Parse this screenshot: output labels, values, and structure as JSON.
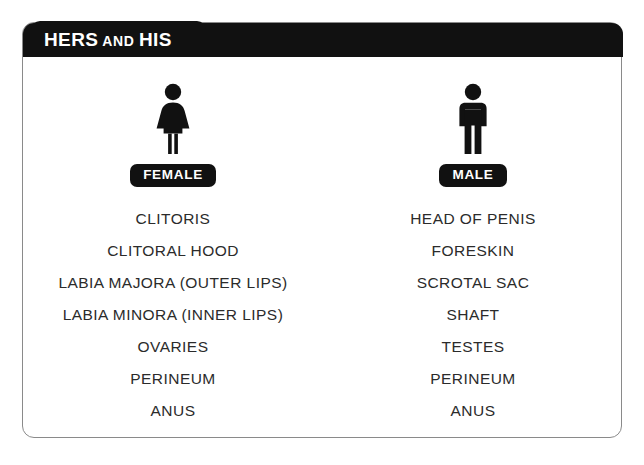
{
  "page": {
    "background_color": "#ffffff",
    "card_border_color": "#8a8a8a",
    "accent_color": "#111111",
    "text_color": "#2b2b2b"
  },
  "header": {
    "title_part1": "HERS",
    "title_conjunction": "AND",
    "title_part2": "HIS"
  },
  "columns": [
    {
      "icon": "female-pictogram-icon",
      "badge_label": "FEMALE",
      "terms": [
        "CLITORIS",
        "CLITORAL HOOD",
        "LABIA MAJORA (OUTER LIPS)",
        "LABIA MINORA (INNER LIPS)",
        "OVARIES",
        "PERINEUM",
        "ANUS"
      ]
    },
    {
      "icon": "male-pictogram-icon",
      "badge_label": "MALE",
      "terms": [
        "HEAD OF PENIS",
        "FORESKIN",
        "SCROTAL SAC",
        "SHAFT",
        "TESTES",
        "PERINEUM",
        "ANUS"
      ]
    }
  ]
}
